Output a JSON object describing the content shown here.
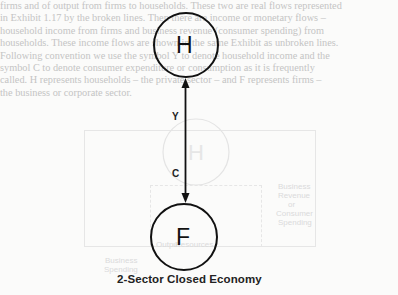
{
  "background_text": {
    "lines": [
      "firms and of output from firms to households. These two are real flows represented",
      "in Exhibit 1.17 by the broken lines. Then there are income or monetary flows –",
      "household income from firms and business revenue (consumer spending) from",
      "households. These income flows are shown in the same Exhibit as unbroken lines.",
      "Following convention we use the symbol Y to denote household income and the",
      "symbol C to denote consumer expenditure or consumption as it is frequently",
      "called. H represents households – the private sector – and F represents firms –",
      "the business or corporate sector."
    ],
    "ghost_labels": [
      "Business",
      "Revenue",
      "or",
      "Consumer",
      "Spending",
      "Output",
      "Resources",
      "Business",
      "Spending"
    ]
  },
  "diagram": {
    "nodes": [
      {
        "id": "households",
        "label": "H"
      },
      {
        "id": "firms",
        "label": "F"
      }
    ],
    "flows": [
      {
        "label": "Y",
        "from": "firms",
        "to": "households"
      },
      {
        "label": "C",
        "from": "households",
        "to": "firms"
      }
    ],
    "caption": "2-Sector Closed Economy",
    "line_color": "#111111"
  }
}
